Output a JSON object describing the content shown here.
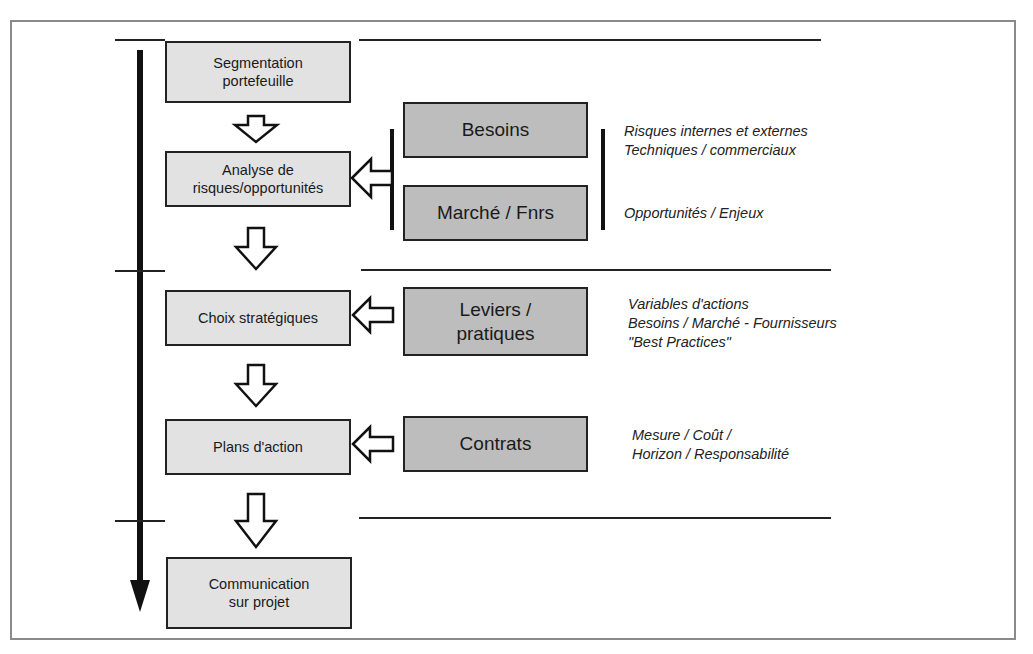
{
  "figure": {
    "caption_fragment": "",
    "colors": {
      "frame": "#8a8a8a",
      "process_box": "#e2e2e2",
      "input_box": "#bdbdbd",
      "line": "#222222"
    }
  },
  "process_steps": [
    {
      "id": "segmentation",
      "label": "Segmentation\nportefeuille"
    },
    {
      "id": "analyse",
      "label": "Analyse de\nrisques/opportunités"
    },
    {
      "id": "choix",
      "label": "Choix stratégiques"
    },
    {
      "id": "plans",
      "label": "Plans d'action"
    },
    {
      "id": "communication",
      "label": "Communication\nsur projet"
    }
  ],
  "inputs": [
    {
      "id": "besoins",
      "label": "Besoins"
    },
    {
      "id": "marche",
      "label": "Marché / Fnrs"
    },
    {
      "id": "leviers",
      "label": "Leviers /\npratiques"
    },
    {
      "id": "contrats",
      "label": "Contrats"
    }
  ],
  "notes": {
    "besoins_line1": "Risques internes et externes",
    "besoins_line2": "Techniques / commerciaux",
    "marche_line1": "Opportunités / Enjeux",
    "leviers_line1": "Variables d'actions",
    "leviers_line2": "Besoins / Marché - Fournisseurs",
    "leviers_line3": "\"Best Practices\"",
    "contrats_line1": "Mesure / Coût /",
    "contrats_line2": "Horizon / Responsabilité"
  },
  "icons": {
    "timeline_arrow": "arrow-down-icon",
    "flow_arrow": "hollow-arrow-down-icon",
    "input_arrow": "hollow-arrow-left-icon"
  }
}
